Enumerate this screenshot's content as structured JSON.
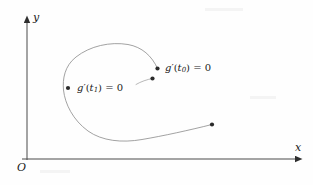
{
  "figure": {
    "background_color": "#fefefe",
    "ink_color": "#3a3a3a",
    "text_color": "#1a1a1a",
    "width": 313,
    "height": 185
  },
  "axes": {
    "y_label": "y",
    "x_label": "x",
    "origin_label": "O",
    "x_axis": {
      "x1": 22,
      "y1": 159,
      "x2": 300,
      "y2": 159
    },
    "y_axis": {
      "x1": 27,
      "y1": 160,
      "x2": 27,
      "y2": 17
    }
  },
  "annotations": [
    {
      "id": "t0",
      "function": "g",
      "prime": "′",
      "open_paren": "(",
      "variable": "t",
      "subscript": "0",
      "close_paren": ")",
      "equals": "= 0",
      "full_text": "g′(t₀) = 0",
      "point": {
        "x": 157,
        "y": 68
      }
    },
    {
      "id": "t1",
      "function": "g",
      "prime": "′",
      "open_paren": "(",
      "variable": "t",
      "subscript": "1",
      "close_paren": ")",
      "equals": "= 0",
      "full_text": "g′(t₁) = 0",
      "point": {
        "x": 68,
        "y": 88
      }
    }
  ],
  "curve": {
    "type": "parametric-spiral",
    "stroke_width": 0.7,
    "path": "M 157.5 68.5 C 152 56 142 47 128 44.5 C 110 41.5 90 46 76 57 C 64.5 66 62.5 79 63.5 90 C 65 104 73 120 88 131 C 102 141 122 143 142 139.5 C 163 136 190 130 212 124.5",
    "marked_points": [
      {
        "name": "critical-point-t0",
        "x": 157.5,
        "y": 68.5,
        "r": 2.1
      },
      {
        "name": "inner-point",
        "x": 152.5,
        "y": 78.5,
        "r": 2.1
      },
      {
        "name": "critical-point-t1",
        "x": 68,
        "y": 88,
        "r": 2.1
      },
      {
        "name": "curve-endpoint",
        "x": 212,
        "y": 124.5,
        "r": 2.1
      }
    ],
    "inner_tail_path": "M 152.5 78.5 C 146 79.5 139 82 133 86"
  }
}
